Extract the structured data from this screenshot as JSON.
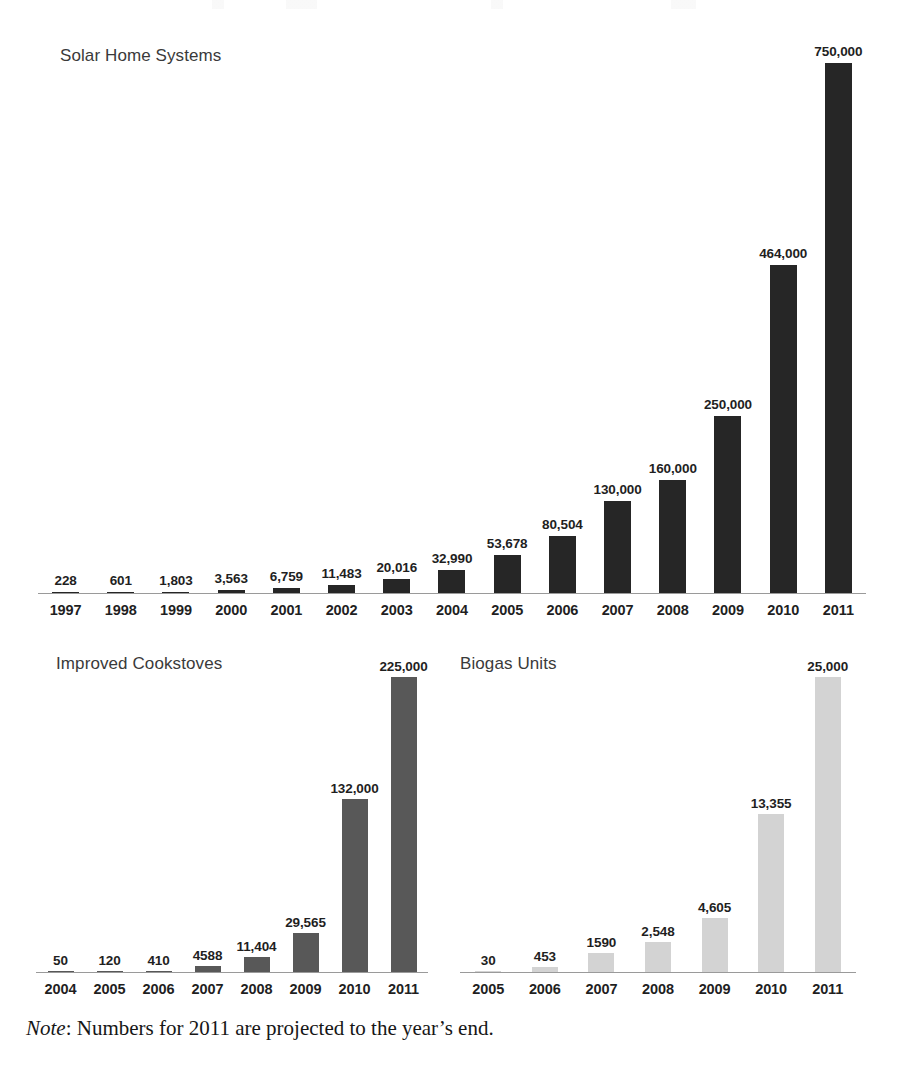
{
  "footnote": {
    "note_word": "Note",
    "text": ": Numbers for 2011 are projected to the year’s end."
  },
  "colors": {
    "solar_bar": "#262626",
    "cookstove_bar": "#585858",
    "biogas_bar": "#d3d3d3",
    "axis": "#9a9a9a",
    "title_text": "#3a3a3a",
    "label_text": "#1f1f1f",
    "background": "#ffffff"
  },
  "chart_data": [
    {
      "id": "solar-home-systems",
      "type": "bar",
      "title": "Solar Home Systems",
      "xlabel": "",
      "ylabel": "",
      "grid": false,
      "legend": "none",
      "ylim": [
        0,
        750000
      ],
      "categories": [
        "1997",
        "1998",
        "1999",
        "2000",
        "2001",
        "2002",
        "2003",
        "2004",
        "2005",
        "2006",
        "2007",
        "2008",
        "2009",
        "2010",
        "2011"
      ],
      "values": [
        228,
        601,
        1803,
        3563,
        6759,
        11483,
        20016,
        32990,
        53678,
        80504,
        130000,
        160000,
        250000,
        464000,
        750000
      ],
      "value_labels": [
        "228",
        "601",
        "1,803",
        "3,563",
        "6,759",
        "11,483",
        "20,016",
        "32,990",
        "53,678",
        "80,504",
        "130,000",
        "160,000",
        "250,000",
        "464,000",
        "750,000"
      ]
    },
    {
      "id": "improved-cookstoves",
      "type": "bar",
      "title": "Improved Cookstoves",
      "xlabel": "",
      "ylabel": "",
      "grid": false,
      "legend": "none",
      "ylim": [
        0,
        225000
      ],
      "categories": [
        "2004",
        "2005",
        "2006",
        "2007",
        "2008",
        "2009",
        "2010",
        "2011"
      ],
      "values": [
        50,
        120,
        410,
        4588,
        11404,
        29565,
        132000,
        225000
      ],
      "value_labels": [
        "50",
        "120",
        "410",
        "4588",
        "11,404",
        "29,565",
        "132,000",
        "225,000"
      ]
    },
    {
      "id": "biogas-units",
      "type": "bar",
      "title": "Biogas Units",
      "xlabel": "",
      "ylabel": "",
      "grid": false,
      "legend": "none",
      "ylim": [
        0,
        25000
      ],
      "categories": [
        "2005",
        "2006",
        "2007",
        "2008",
        "2009",
        "2010",
        "2011"
      ],
      "values": [
        30,
        453,
        1590,
        2548,
        4605,
        13355,
        25000
      ],
      "value_labels": [
        "30",
        "453",
        "1590",
        "2,548",
        "4,605",
        "13,355",
        "25,000"
      ]
    }
  ]
}
